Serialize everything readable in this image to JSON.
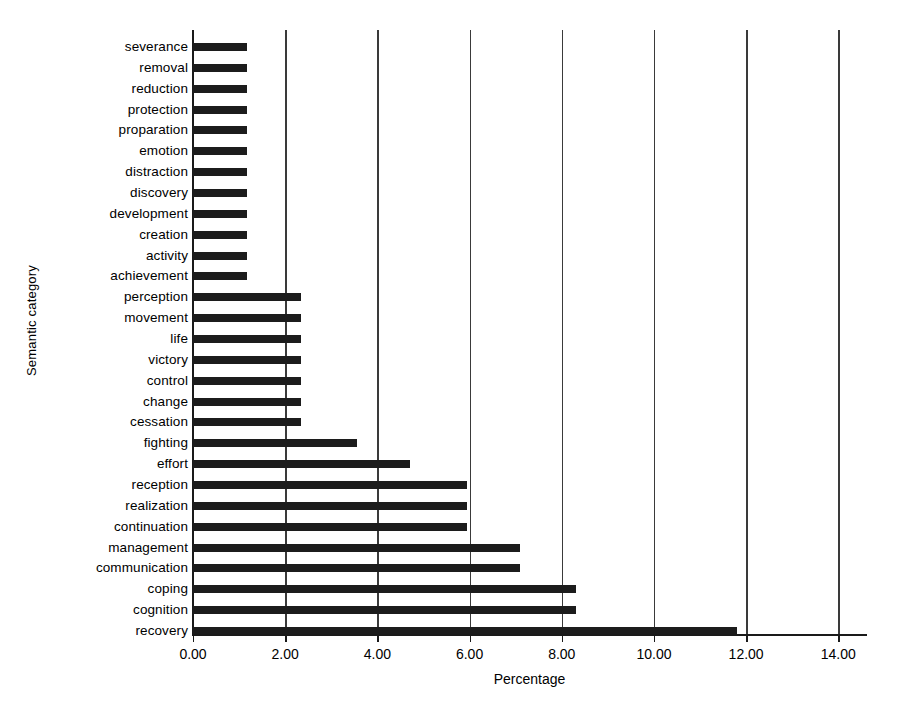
{
  "chart_data": {
    "type": "bar",
    "orientation": "horizontal",
    "title": "",
    "xlabel": "Percentage",
    "ylabel": "Semantic category",
    "xlim": [
      0,
      14.6
    ],
    "ylim": [
      0,
      29
    ],
    "xticks": [
      "0.00",
      "2.00",
      "4.00",
      "6.00",
      "8.00",
      "10.00",
      "12.00",
      "14.00"
    ],
    "xtick_values": [
      0,
      2,
      4,
      6,
      8,
      10,
      12,
      14
    ],
    "grid": "vertical",
    "legend": "none",
    "bar_color": "#1c1c1c",
    "categories": [
      "severance",
      "removal",
      "reduction",
      "protection",
      "proparation",
      "emotion",
      "distraction",
      "discovery",
      "development",
      "creation",
      "activity",
      "achievement",
      "perception",
      "movement",
      "life",
      "victory",
      "control",
      "change",
      "cessation",
      "fighting",
      "effort",
      "reception",
      "realization",
      "continuation",
      "management",
      "communication",
      "coping",
      "cognition",
      "recovery"
    ],
    "values": [
      1.18,
      1.18,
      1.18,
      1.18,
      1.18,
      1.18,
      1.18,
      1.18,
      1.18,
      1.18,
      1.18,
      1.18,
      2.35,
      2.35,
      2.35,
      2.35,
      2.35,
      2.35,
      2.35,
      3.55,
      4.7,
      5.95,
      5.95,
      5.95,
      7.1,
      7.1,
      8.3,
      8.3,
      11.8
    ]
  },
  "caption": {
    "text": ""
  }
}
